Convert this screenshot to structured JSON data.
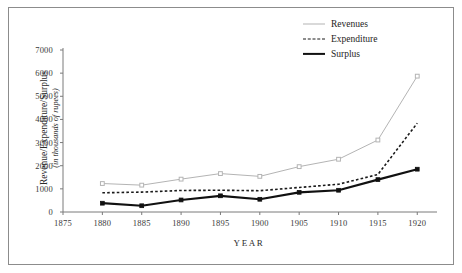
{
  "chart_data": {
    "type": "line",
    "title": "",
    "xlabel": "YEAR",
    "ylabel": "Revenue/Expenditure/Surplus",
    "ylabel_sub": "(in thousands of rupees)",
    "x": [
      1880,
      1885,
      1890,
      1895,
      1900,
      1905,
      1910,
      1915,
      1920
    ],
    "categories": [
      "1880",
      "1885",
      "1890",
      "1895",
      "1900",
      "1905",
      "1910",
      "1915",
      "1920"
    ],
    "xlim": [
      1875,
      1922
    ],
    "ylim": [
      0,
      7000
    ],
    "xticks": [
      1875,
      1880,
      1885,
      1890,
      1895,
      1900,
      1905,
      1910,
      1915,
      1920
    ],
    "xticklabels": [
      "1875",
      "1880",
      "1885",
      "1890",
      "1895",
      "1900",
      "1905",
      "1910",
      "1915",
      "1920"
    ],
    "yticks": [
      0,
      1000,
      2000,
      3000,
      4000,
      5000,
      6000,
      7000
    ],
    "yticklabels": [
      "0",
      "1000",
      "2000",
      "3000",
      "4000",
      "5000",
      "6000",
      "7000"
    ],
    "grid": false,
    "legend_position": "top-right",
    "series": [
      {
        "name": "Revenues",
        "color": "#b4b4b4",
        "style": "solid",
        "width": 1,
        "marker": "square-open",
        "values": [
          1230,
          1160,
          1420,
          1660,
          1540,
          1960,
          2280,
          3110,
          5870
        ]
      },
      {
        "name": "Expenditure",
        "color": "#1a1a1a",
        "style": "dashed",
        "width": 1.6,
        "marker": "none",
        "values": [
          830,
          860,
          930,
          940,
          920,
          1060,
          1200,
          1620,
          3840
        ]
      },
      {
        "name": "Surplus",
        "color": "#111111",
        "style": "solid",
        "width": 2.2,
        "marker": "square-filled",
        "values": [
          380,
          270,
          520,
          700,
          550,
          850,
          940,
          1400,
          1850
        ]
      }
    ]
  },
  "legend": {
    "items": [
      {
        "label": "Revenues"
      },
      {
        "label": "Expenditure"
      },
      {
        "label": "Surplus"
      }
    ]
  },
  "axes": {
    "x_title": "YEAR",
    "y_title_main": "Revenue/Expenditure/Surplus",
    "y_title_sub": "(in thousands of rupees)"
  },
  "colors": {
    "frame": "#8c8c8c",
    "axis": "#7a7a7a",
    "text": "#2b2b2b",
    "revenues": "#b4b4b4",
    "expenditure": "#1a1a1a",
    "surplus": "#111111",
    "background": "#ffffff"
  }
}
